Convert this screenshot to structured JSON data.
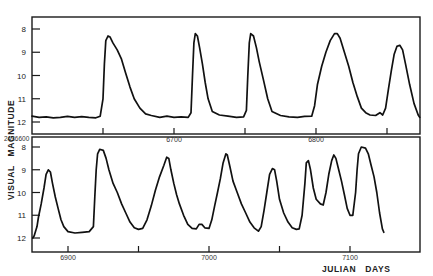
{
  "chart_data": {
    "type": "line",
    "title": "",
    "xlabel": "JULIAN DAYS",
    "ylabel": "VISUAL MAGNITUDE",
    "y_inverted": true,
    "grid": false,
    "legend": null,
    "panels": [
      {
        "name": "top",
        "x_start_label": "2436600",
        "xlim": [
          6600,
          6873
        ],
        "ylim": [
          12,
          8
        ],
        "y_ticks": [
          8,
          9,
          10,
          11,
          12
        ],
        "x_ticks": [
          6650,
          6700,
          6750,
          6800,
          6850
        ],
        "x_tick_labels": {
          "6700": "6700",
          "6800": "6800"
        },
        "series": [
          {
            "name": "visual magnitude",
            "points": [
              [
                6600,
                11.75
              ],
              [
                6605,
                11.8
              ],
              [
                6610,
                11.78
              ],
              [
                6615,
                11.82
              ],
              [
                6620,
                11.8
              ],
              [
                6625,
                11.76
              ],
              [
                6630,
                11.8
              ],
              [
                6635,
                11.77
              ],
              [
                6640,
                11.8
              ],
              [
                6645,
                11.82
              ],
              [
                6648,
                11.75
              ],
              [
                6650,
                11.0
              ],
              [
                6651,
                9.5
              ],
              [
                6652,
                8.5
              ],
              [
                6653.5,
                8.3
              ],
              [
                6655,
                8.35
              ],
              [
                6657,
                8.6
              ],
              [
                6660,
                8.9
              ],
              [
                6663,
                9.3
              ],
              [
                6666,
                9.9
              ],
              [
                6669,
                10.5
              ],
              [
                6672,
                11.0
              ],
              [
                6676,
                11.4
              ],
              [
                6680,
                11.65
              ],
              [
                6684,
                11.72
              ],
              [
                6690,
                11.8
              ],
              [
                6695,
                11.75
              ],
              [
                6700,
                11.8
              ],
              [
                6705,
                11.78
              ],
              [
                6710,
                11.8
              ],
              [
                6712,
                11.6
              ],
              [
                6713,
                10.0
              ],
              [
                6714,
                8.6
              ],
              [
                6715,
                8.2
              ],
              [
                6716.5,
                8.3
              ],
              [
                6718,
                8.8
              ],
              [
                6720,
                9.5
              ],
              [
                6722,
                10.3
              ],
              [
                6724,
                11.0
              ],
              [
                6727,
                11.55
              ],
              [
                6732,
                11.7
              ],
              [
                6738,
                11.75
              ],
              [
                6744,
                11.8
              ],
              [
                6749,
                11.78
              ],
              [
                6751,
                11.5
              ],
              [
                6752,
                10.0
              ],
              [
                6753,
                8.6
              ],
              [
                6754,
                8.2
              ],
              [
                6756,
                8.3
              ],
              [
                6758,
                8.8
              ],
              [
                6760,
                9.4
              ],
              [
                6763,
                10.2
              ],
              [
                6766,
                11.0
              ],
              [
                6769,
                11.55
              ],
              [
                6775,
                11.72
              ],
              [
                6781,
                11.78
              ],
              [
                6787,
                11.8
              ],
              [
                6792,
                11.76
              ],
              [
                6797,
                11.75
              ],
              [
                6799,
                11.3
              ],
              [
                6801,
                10.4
              ],
              [
                6804,
                9.6
              ],
              [
                6807,
                9.0
              ],
              [
                6810,
                8.5
              ],
              [
                6813,
                8.2
              ],
              [
                6815,
                8.2
              ],
              [
                6817,
                8.4
              ],
              [
                6820,
                9.0
              ],
              [
                6823,
                9.6
              ],
              [
                6826,
                10.3
              ],
              [
                6829,
                10.9
              ],
              [
                6832,
                11.4
              ],
              [
                6835,
                11.6
              ],
              [
                6838,
                11.7
              ],
              [
                6842,
                11.72
              ],
              [
                6845,
                11.6
              ],
              [
                6847,
                11.7
              ],
              [
                6849,
                11.4
              ],
              [
                6851,
                10.6
              ],
              [
                6853,
                9.8
              ],
              [
                6855,
                9.1
              ],
              [
                6857,
                8.75
              ],
              [
                6859,
                8.7
              ],
              [
                6861,
                8.9
              ],
              [
                6863,
                9.5
              ],
              [
                6866,
                10.4
              ],
              [
                6869,
                11.2
              ],
              [
                6872,
                11.7
              ],
              [
                6873,
                11.8
              ]
            ]
          }
        ]
      },
      {
        "name": "bottom",
        "x_start_label": "2436600",
        "xlim": [
          6875,
          7150
        ],
        "ylim": [
          12,
          8
        ],
        "y_ticks": [
          8,
          9,
          10,
          11,
          12
        ],
        "x_ticks": [
          6900,
          6950,
          7000,
          7050,
          7100
        ],
        "x_tick_labels": {
          "6900": "6900",
          "7000": "7000",
          "7100": "7100"
        },
        "series": [
          {
            "name": "visual magnitude",
            "points": [
              [
                6875,
                12.0
              ],
              [
                6876,
                11.9
              ],
              [
                6878,
                11.5
              ],
              [
                6879,
                11.1
              ],
              [
                6881,
                10.5
              ],
              [
                6883,
                9.8
              ],
              [
                6884.5,
                9.2
              ],
              [
                6886,
                9.0
              ],
              [
                6887.5,
                9.1
              ],
              [
                6889,
                9.6
              ],
              [
                6891,
                10.2
              ],
              [
                6893,
                10.7
              ],
              [
                6895,
                11.2
              ],
              [
                6897,
                11.5
              ],
              [
                6900,
                11.72
              ],
              [
                6905,
                11.78
              ],
              [
                6910,
                11.75
              ],
              [
                6915,
                11.72
              ],
              [
                6918,
                11.5
              ],
              [
                6919,
                10.2
              ],
              [
                6920,
                9.0
              ],
              [
                6921,
                8.3
              ],
              [
                6922.5,
                8.1
              ],
              [
                6925,
                8.15
              ],
              [
                6927,
                8.5
              ],
              [
                6929,
                9.0
              ],
              [
                6932,
                9.6
              ],
              [
                6935,
                10.0
              ],
              [
                6938,
                10.5
              ],
              [
                6941,
                10.9
              ],
              [
                6944,
                11.3
              ],
              [
                6947,
                11.55
              ],
              [
                6950,
                11.62
              ],
              [
                6953,
                11.58
              ],
              [
                6956,
                11.2
              ],
              [
                6959,
                10.6
              ],
              [
                6962,
                9.9
              ],
              [
                6965,
                9.3
              ],
              [
                6968,
                8.8
              ],
              [
                6970,
                8.45
              ],
              [
                6971.5,
                8.5
              ],
              [
                6973,
                9.0
              ],
              [
                6975,
                9.6
              ],
              [
                6977,
                10.1
              ],
              [
                6979,
                10.5
              ],
              [
                6982,
                11.0
              ],
              [
                6985,
                11.4
              ],
              [
                6988,
                11.58
              ],
              [
                6991,
                11.6
              ],
              [
                6993,
                11.4
              ],
              [
                6995,
                11.4
              ],
              [
                6997,
                11.55
              ],
              [
                7000,
                11.58
              ],
              [
                7002,
                11.2
              ],
              [
                7004,
                10.6
              ],
              [
                7006,
                10.0
              ],
              [
                7008,
                9.4
              ],
              [
                7010,
                8.7
              ],
              [
                7012,
                8.3
              ],
              [
                7013,
                8.35
              ],
              [
                7015,
                8.9
              ],
              [
                7017,
                9.5
              ],
              [
                7020,
                10.0
              ],
              [
                7023,
                10.5
              ],
              [
                7026,
                10.9
              ],
              [
                7029,
                11.3
              ],
              [
                7032,
                11.55
              ],
              [
                7035,
                11.7
              ],
              [
                7037,
                11.5
              ],
              [
                7039,
                10.8
              ],
              [
                7041,
                10.0
              ],
              [
                7043,
                9.2
              ],
              [
                7045,
                8.95
              ],
              [
                7046.5,
                9.0
              ],
              [
                7048,
                9.5
              ],
              [
                7050,
                10.3
              ],
              [
                7053,
                10.9
              ],
              [
                7056,
                11.3
              ],
              [
                7059,
                11.55
              ],
              [
                7062,
                11.62
              ],
              [
                7064,
                11.6
              ],
              [
                7066,
                11.0
              ],
              [
                7068,
                9.6
              ],
              [
                7069,
                8.7
              ],
              [
                7070.5,
                8.6
              ],
              [
                7072,
                9.0
              ],
              [
                7074,
                9.8
              ],
              [
                7076,
                10.3
              ],
              [
                7079,
                10.5
              ],
              [
                7081,
                10.55
              ],
              [
                7083,
                10.0
              ],
              [
                7085,
                9.2
              ],
              [
                7087,
                8.6
              ],
              [
                7088.5,
                8.35
              ],
              [
                7090,
                8.5
              ],
              [
                7092,
                9.0
              ],
              [
                7094,
                9.5
              ],
              [
                7096,
                10.1
              ],
              [
                7098,
                10.7
              ],
              [
                7100,
                11.0
              ],
              [
                7102,
                11.0
              ],
              [
                7104,
                10.0
              ],
              [
                7105,
                9.0
              ],
              [
                7106,
                8.3
              ],
              [
                7108,
                8.0
              ],
              [
                7111,
                8.05
              ],
              [
                7113,
                8.3
              ],
              [
                7115,
                8.8
              ],
              [
                7117,
                9.3
              ],
              [
                7119,
                10.0
              ],
              [
                7121,
                10.9
              ],
              [
                7123,
                11.6
              ],
              [
                7124,
                11.75
              ]
            ]
          }
        ]
      }
    ]
  },
  "labels": {
    "y_axis_title": "VISUAL   MAGNITUDE",
    "x_axis_title": "JULIAN   DAYS",
    "start_label": "2436600",
    "y_tick_labels": [
      "8",
      "9",
      "10",
      "11",
      "12"
    ],
    "top_x_labels": [
      "6700",
      "6800"
    ],
    "bottom_x_labels": [
      "6900",
      "7000",
      "7100"
    ]
  }
}
